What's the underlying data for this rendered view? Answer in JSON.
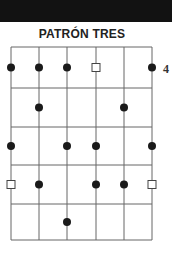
{
  "header": {
    "bar_color": "#121212"
  },
  "title": "PATRÓN TRES",
  "fret_label": "4",
  "grid": {
    "strings": 6,
    "frets": 5,
    "x": [
      11,
      39,
      67,
      96,
      124,
      152
    ],
    "y": [
      47,
      88,
      127,
      165,
      204,
      240
    ],
    "line_color": "#666666"
  },
  "markers": [
    {
      "fret": 1,
      "string": 1,
      "type": "dot"
    },
    {
      "fret": 1,
      "string": 2,
      "type": "dot"
    },
    {
      "fret": 1,
      "string": 3,
      "type": "dot"
    },
    {
      "fret": 1,
      "string": 4,
      "type": "square"
    },
    {
      "fret": 1,
      "string": 6,
      "type": "dot"
    },
    {
      "fret": 2,
      "string": 2,
      "type": "dot"
    },
    {
      "fret": 2,
      "string": 5,
      "type": "dot"
    },
    {
      "fret": 3,
      "string": 1,
      "type": "dot"
    },
    {
      "fret": 3,
      "string": 3,
      "type": "dot"
    },
    {
      "fret": 3,
      "string": 4,
      "type": "dot"
    },
    {
      "fret": 3,
      "string": 6,
      "type": "dot"
    },
    {
      "fret": 4,
      "string": 1,
      "type": "square"
    },
    {
      "fret": 4,
      "string": 2,
      "type": "dot"
    },
    {
      "fret": 4,
      "string": 4,
      "type": "dot"
    },
    {
      "fret": 4,
      "string": 5,
      "type": "dot"
    },
    {
      "fret": 4,
      "string": 6,
      "type": "square"
    },
    {
      "fret": 5,
      "string": 3,
      "type": "dot"
    }
  ]
}
